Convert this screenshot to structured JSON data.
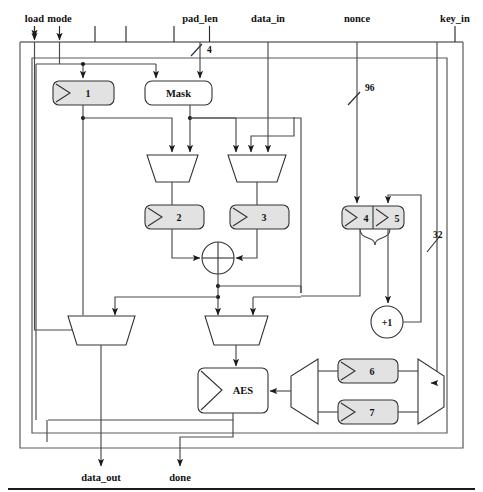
{
  "diagram": {
    "inputs": [
      {
        "name": "load",
        "x": 103,
        "label_y": 22
      },
      {
        "name": "mode",
        "x": 178,
        "label_y": 22
      },
      {
        "name": "pad_len",
        "x": 285,
        "label_y": 22
      },
      {
        "name": "data_in",
        "x": 377,
        "label_y": 22
      },
      {
        "name": "nonce",
        "x": 520,
        "label_y": 22
      },
      {
        "name": "key_in",
        "x": 625,
        "label_y": 22
      }
    ],
    "outputs": [
      {
        "name": "data_out",
        "x": 108,
        "label_y": 470
      },
      {
        "name": "done",
        "x": 187,
        "label_y": 470
      }
    ],
    "bitwidths": [
      {
        "value": "4",
        "x": 207,
        "y": 50
      },
      {
        "value": "96",
        "x": 372,
        "y": 88
      },
      {
        "value": "32",
        "x": 437,
        "y": 239
      }
    ],
    "blocks": [
      {
        "id": "reg1",
        "label": "1",
        "kind": "register"
      },
      {
        "id": "mask",
        "label": "Mask",
        "kind": "logic-box"
      },
      {
        "id": "reg2",
        "label": "2",
        "kind": "register"
      },
      {
        "id": "reg3",
        "label": "3",
        "kind": "register"
      },
      {
        "id": "reg4",
        "label": "4",
        "kind": "register"
      },
      {
        "id": "reg5",
        "label": "5",
        "kind": "register"
      },
      {
        "id": "reg6",
        "label": "6",
        "kind": "register"
      },
      {
        "id": "reg7",
        "label": "7",
        "kind": "register"
      },
      {
        "id": "aes",
        "label": "AES",
        "kind": "register-block"
      },
      {
        "id": "inc",
        "label": "+1",
        "kind": "incrementer"
      },
      {
        "id": "xor",
        "label": "",
        "kind": "xor-gate"
      }
    ],
    "muxes": [
      {
        "id": "mux-reg2-in",
        "inputs": 2
      },
      {
        "id": "mux-reg3-in",
        "inputs": 3
      },
      {
        "id": "mux-dataout",
        "inputs": 2
      },
      {
        "id": "mux-aes-in",
        "inputs": 2
      },
      {
        "id": "demux-key",
        "inputs": 1
      },
      {
        "id": "mux-key",
        "inputs": 2
      }
    ]
  }
}
